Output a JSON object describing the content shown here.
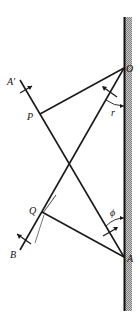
{
  "diagram": {
    "labels": {
      "O": "O",
      "A": "A",
      "P": "P",
      "Q": "Q",
      "A_prime": "A′",
      "B": "B",
      "r": "r",
      "phi": "ϕ"
    },
    "colors": {
      "line": "#1a1a1a",
      "wall_hatch": "#9a9a9a",
      "background": "#ffffff"
    },
    "points": {
      "O": [
        124,
        68
      ],
      "A": [
        124,
        257
      ],
      "P": [
        40,
        114
      ],
      "Q": [
        42,
        212
      ]
    }
  }
}
